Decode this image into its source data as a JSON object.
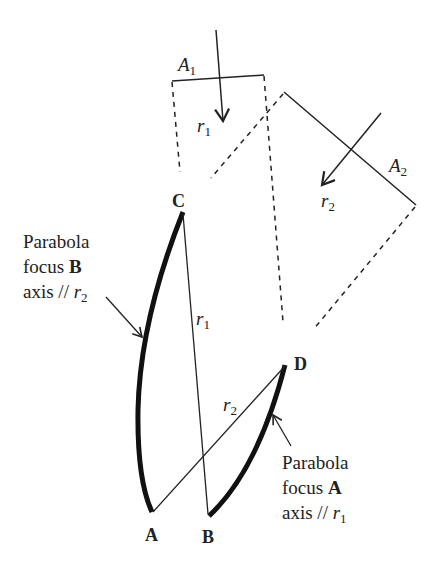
{
  "diagram": {
    "type": "geometry",
    "aperture_1": {
      "label": "A",
      "subscript": "1"
    },
    "aperture_2": {
      "label": "A",
      "subscript": "2"
    },
    "ray_1": {
      "label": "r",
      "subscript": "1"
    },
    "ray_2": {
      "label": "r",
      "subscript": "2"
    },
    "points": {
      "A": "A",
      "B": "B",
      "C": "C",
      "D": "D"
    },
    "segment_CB_label": {
      "label": "r",
      "subscript": "1"
    },
    "segment_AD_label": {
      "label": "r",
      "subscript": "2"
    },
    "annotation_left": {
      "line1": "Parabola",
      "line2_prefix": "focus ",
      "line2_bold": "B",
      "line3_prefix": "axis // ",
      "line3_var": "r",
      "line3_sub": "2"
    },
    "annotation_right": {
      "line1": "Parabola",
      "line2_prefix": "focus ",
      "line2_bold": "A",
      "line3_prefix": "axis // ",
      "line3_var": "r",
      "line3_sub": "1"
    },
    "colors": {
      "stroke": "#222222",
      "background": "#ffffff"
    }
  }
}
